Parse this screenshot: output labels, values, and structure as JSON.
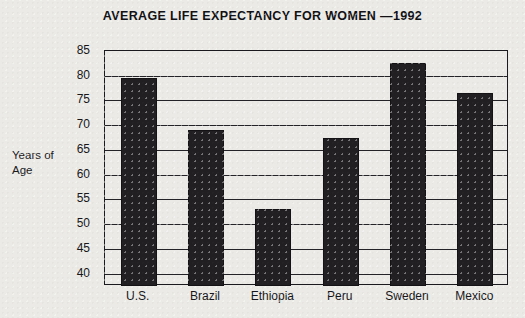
{
  "chart_data": {
    "type": "bar",
    "title": "AVERAGE LIFE EXPECTANCY FOR WOMEN —1992",
    "xlabel": "",
    "ylabel": "Years of Age",
    "ylabel_lines": [
      "Years of",
      "Age"
    ],
    "categories": [
      "U.S.",
      "Brazil",
      "Ethiopia",
      "Peru",
      "Sweden",
      "Mexico"
    ],
    "values": [
      79.5,
      69,
      53,
      67.5,
      82.5,
      76.5
    ],
    "ylim": [
      37.5,
      85
    ],
    "yticks": [
      85,
      80,
      75,
      70,
      65,
      60,
      55,
      50,
      45,
      40
    ],
    "ytick_labels": [
      "85",
      "80",
      "75",
      "70",
      "65",
      "60",
      "55",
      "50",
      "45",
      "40"
    ],
    "grid": true,
    "legend": false,
    "bar_color": "#221f22",
    "plot_background": "#eceae7",
    "axis_color": "#1a191d"
  }
}
